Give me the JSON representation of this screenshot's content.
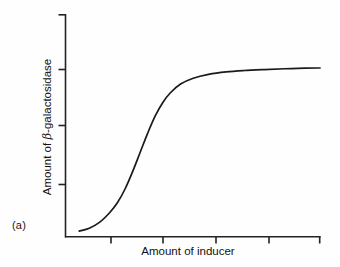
{
  "figure": {
    "panel_label": "(a)",
    "background_color": "#fefefe",
    "line_color": "#1a1a1a",
    "axis_color": "#222222"
  },
  "chart_data": {
    "type": "line",
    "title": "",
    "subtitle": "",
    "xlabel": "Amount of inducer",
    "ylabel_prefix": "Amount of ",
    "ylabel_symbol": "β",
    "ylabel_suffix": "-galactosidase",
    "ylabel": "Amount of β-galactosidase",
    "xlim": [
      0,
      10
    ],
    "ylim": [
      0,
      10
    ],
    "x_tick_labels": [
      "",
      "",
      "",
      "",
      ""
    ],
    "y_tick_labels": [
      "",
      "",
      "",
      ""
    ],
    "x_tick_values": [
      2,
      4,
      6,
      8,
      10
    ],
    "y_tick_values": [
      3.2,
      5.6,
      7.8,
      10
    ],
    "grid": false,
    "legend": "none",
    "annotations": [],
    "series": [
      {
        "name": "beta-galactosidase induction",
        "shape": "sigmoid",
        "x": [
          0.5,
          0.9,
          1.3,
          1.7,
          2.0,
          2.3,
          2.6,
          2.9,
          3.2,
          3.5,
          3.8,
          4.1,
          4.5,
          5.0,
          5.6,
          6.3,
          7.0,
          7.8,
          8.6,
          9.4,
          10.0
        ],
        "y": [
          0.15,
          0.3,
          0.6,
          1.1,
          1.6,
          2.3,
          3.2,
          4.2,
          5.2,
          6.1,
          6.8,
          7.3,
          7.75,
          8.05,
          8.25,
          8.38,
          8.45,
          8.5,
          8.54,
          8.57,
          8.58
        ]
      }
    ]
  }
}
